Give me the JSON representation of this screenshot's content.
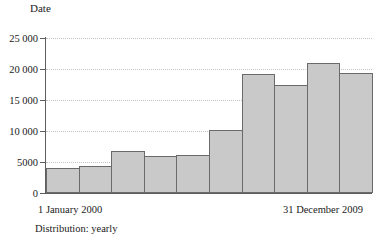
{
  "chart_data": {
    "type": "bar",
    "title": "Date",
    "xlabel": "",
    "ylabel": "",
    "categories": [
      "2000",
      "2001",
      "2002",
      "2003",
      "2004",
      "2005",
      "2006",
      "2007",
      "2008",
      "2009"
    ],
    "values": [
      4000,
      4300,
      6800,
      6000,
      6200,
      10100,
      19200,
      17500,
      21000,
      19300
    ],
    "ylim": [
      0,
      25000
    ],
    "y_ticks": [
      0,
      5000,
      10000,
      15000,
      20000,
      25000
    ],
    "y_tick_labels": [
      "0",
      "5000",
      "10 000",
      "15 000",
      "20 000",
      "25 000"
    ],
    "grid": true,
    "grid_style": "dotted",
    "legend": false,
    "bar_gap": 0,
    "bar_fill_color": "#c9c9c9",
    "bar_edge_color": "#6a6a6a",
    "gridline_color": "#c4c4c4",
    "axis_color": "#5d5d5d"
  },
  "axis": {
    "range_start_label": "1 January 2000",
    "range_end_label": "31 December 2009"
  },
  "footer": {
    "distribution_label": "Distribution: yearly"
  }
}
